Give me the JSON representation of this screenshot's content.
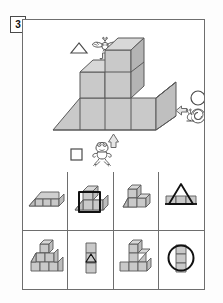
{
  "worksheet": {
    "question_number": "3",
    "type": "visual-reasoning-block-counting-puzzle"
  },
  "stimulus": {
    "legend": [
      {
        "id": "bird",
        "creature": "bird-icon",
        "shape": "triangle",
        "shape_symbol": "△",
        "arrow": "down",
        "arrow_symbol": "⇓",
        "position": "top"
      },
      {
        "id": "snail",
        "creature": "snail-icon",
        "shape": "circle",
        "shape_symbol": "○",
        "arrow": "left",
        "arrow_symbol": "⇐",
        "position": "right"
      },
      {
        "id": "frog",
        "creature": "frog-icon",
        "shape": "square",
        "shape_symbol": "□",
        "arrow": "up",
        "arrow_symbol": "⇑",
        "position": "bottom"
      }
    ],
    "figure": {
      "name": "isometric-block-structure",
      "description": "staircase of cubes on a ground plane",
      "cube_count": 6,
      "fill_color": "#c9c9c9",
      "stroke_color": "#595959"
    }
  },
  "options": [
    {
      "index": 1,
      "label": "option-1",
      "figure": "row-of-three-cubes-with-ramp",
      "overlay": "none"
    },
    {
      "index": 2,
      "label": "option-2",
      "figure": "stacked-cubes-with-ramp",
      "overlay": "square"
    },
    {
      "index": 3,
      "label": "option-3",
      "figure": "l-shaped-cube-arrangement",
      "overlay": "none"
    },
    {
      "index": 4,
      "label": "option-4",
      "figure": "row-of-three-cubes",
      "overlay": "triangle"
    },
    {
      "index": 5,
      "label": "option-5",
      "figure": "pyramid-cubes-with-ramp",
      "overlay": "none"
    },
    {
      "index": 6,
      "label": "option-6",
      "figure": "vertical-stack-of-three-cubes",
      "overlay": "triangle"
    },
    {
      "index": 7,
      "label": "option-7",
      "figure": "t-shaped-cubes-with-ramp",
      "overlay": "none"
    },
    {
      "index": 8,
      "label": "option-8",
      "figure": "vertical-stack-of-three-cubes",
      "overlay": "circle"
    }
  ],
  "colors": {
    "cube_fill": "#c9c9c9",
    "cube_fill_light": "#d8d8d8",
    "cube_fill_dark": "#b4b4b4",
    "stroke": "#595959",
    "overlay_stroke": "#111111",
    "frame": "#6e6e6e",
    "background": "#ffffff"
  }
}
